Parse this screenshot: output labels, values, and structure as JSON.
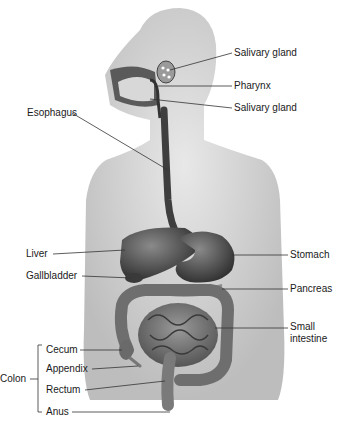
{
  "diagram": {
    "labels_right": {
      "salivary_gland_upper": "Salivary gland",
      "pharynx": "Pharynx",
      "salivary_gland_lower": "Salivary gland",
      "stomach": "Stomach",
      "pancreas": "Pancreas",
      "small_intestine_line1": "Small",
      "small_intestine_line2": "intestine"
    },
    "labels_left": {
      "esophagus": "Esophagus",
      "liver": "Liver",
      "gallbladder": "Gallbladder",
      "colon": "Colon",
      "cecum": "Cecum",
      "appendix": "Appendix",
      "rectum": "Rectum",
      "anus": "Anus"
    },
    "colors": {
      "body": "#dcdcdc",
      "organ_dark": "#4a4a4a",
      "organ_mid": "#7a7a7a",
      "leader_line": "#333333"
    }
  }
}
